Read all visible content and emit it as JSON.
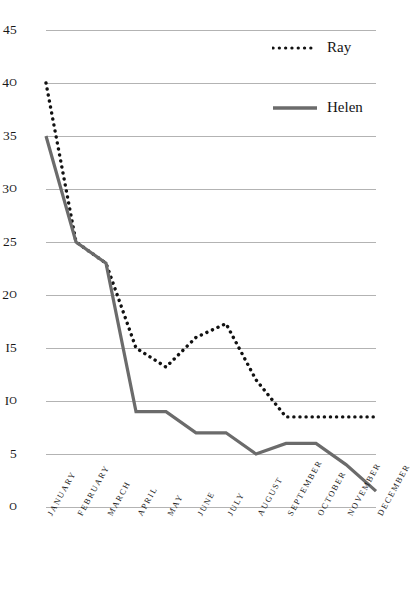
{
  "chart_data": {
    "type": "line",
    "title": "",
    "xlabel": "",
    "ylabel": "",
    "categories": [
      "JANUARY",
      "FEBRUARY",
      "MARCH",
      "APRIL",
      "MAY",
      "JUNE",
      "JULY",
      "AUGUST",
      "SEPTEMBER",
      "OCTOBER",
      "NOVEMBER",
      "DECEMBER"
    ],
    "series": [
      {
        "name": "Ray",
        "style": "dotted",
        "color": "#111111",
        "values": [
          40,
          25,
          23,
          15,
          13.2,
          16,
          17.3,
          12,
          8.5,
          8.5,
          8.5,
          8.5
        ]
      },
      {
        "name": "Helen",
        "style": "solid",
        "color": "#6b6b6b",
        "values": [
          35,
          25,
          23,
          9,
          9,
          7,
          7,
          5,
          6,
          6,
          4,
          1.5
        ]
      }
    ],
    "ylim": [
      0,
      45
    ],
    "ytick_step": 5,
    "yticks": [
      45,
      40,
      35,
      30,
      25,
      20,
      15,
      10,
      5,
      0
    ],
    "ytick_labels": [
      "45",
      "40",
      "35",
      "30",
      "25",
      "20",
      "15",
      "10",
      "5",
      "0"
    ],
    "grid": true,
    "grid_color": "#b3b3b3",
    "legend_position": "top-right",
    "legend": [
      "Ray",
      "Helen"
    ],
    "background": "#ffffff"
  },
  "legend": {
    "ray_label": "Ray",
    "helen_label": "Helen"
  },
  "title_remnant": "·   ·    ·   ·       ·    ·   ·      ·"
}
